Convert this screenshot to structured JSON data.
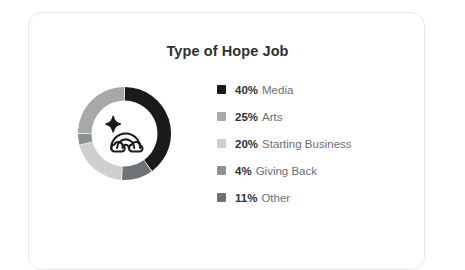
{
  "card": {
    "title": "Type of Hope Job",
    "background_color": "#ffffff",
    "border_color": "#e6e7e8"
  },
  "center_icon": {
    "name": "rainbow-with-clouds-and-sparkle-icon",
    "stroke_color": "#1a1a1a"
  },
  "legend": {
    "items": [
      {
        "percent": "40%",
        "label": "Media",
        "color": "#1a1a1a"
      },
      {
        "percent": "25%",
        "label": "Arts",
        "color": "#a6a8aa"
      },
      {
        "percent": "20%",
        "label": "Starting Business",
        "color": "#cdcfd1"
      },
      {
        "percent": "4%",
        "label": "Giving Back",
        "color": "#8e9193"
      },
      {
        "percent": "11%",
        "label": "Other",
        "color": "#6f7275"
      }
    ]
  },
  "chart_data": {
    "type": "pie",
    "variant": "donut",
    "title": "Type of Hope Job",
    "categories": [
      "Media",
      "Arts",
      "Starting Business",
      "Giving Back",
      "Other"
    ],
    "values": [
      40,
      25,
      20,
      4,
      11
    ],
    "unit": "%",
    "colors": [
      "#1a1a1a",
      "#a6a8aa",
      "#cdcfd1",
      "#8e9193",
      "#6f7275"
    ],
    "start_angle_deg": 0,
    "direction": "clockwise",
    "legend_position": "right",
    "grid": false,
    "xlabel": "",
    "ylabel": "",
    "segment_order_clockwise": [
      "Media",
      "Other",
      "Starting Business",
      "Giving Back",
      "Arts"
    ],
    "inner_radius_ratio": 0.7
  }
}
